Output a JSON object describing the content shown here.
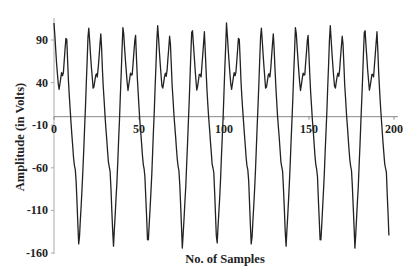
{
  "chart_data": {
    "type": "line",
    "title": "",
    "xlabel": "No. of Samples",
    "ylabel": "Amplitude (in Volts)",
    "xlim": [
      0,
      200
    ],
    "ylim": [
      -160,
      110
    ],
    "x_ticks": [
      0,
      50,
      100,
      150,
      200
    ],
    "y_ticks": [
      90,
      40,
      -10,
      -60,
      -110,
      -160
    ],
    "grid": false,
    "legend": null,
    "series": [
      {
        "name": "Amplitude",
        "color": "#222222",
        "sample_range": [
          0,
          197
        ],
        "period_samples": 20.3,
        "cycle_template": [
          {
            "phase": 0.0,
            "value": 110
          },
          {
            "phase": 0.08,
            "value": 60
          },
          {
            "phase": 0.14,
            "value": 30
          },
          {
            "phase": 0.22,
            "value": 52
          },
          {
            "phase": 0.26,
            "value": 46
          },
          {
            "phase": 0.36,
            "value": 100
          },
          {
            "phase": 0.42,
            "value": 40
          },
          {
            "phase": 0.48,
            "value": 0
          },
          {
            "phase": 0.58,
            "value": -55
          },
          {
            "phase": 0.63,
            "value": -65
          },
          {
            "phase": 0.72,
            "value": -155
          },
          {
            "phase": 0.82,
            "value": -80
          },
          {
            "phase": 0.9,
            "value": 0
          },
          {
            "phase": 1.0,
            "value": 110
          }
        ],
        "first_cycle_x": [
          0,
          1,
          2,
          3,
          4,
          5,
          6,
          7,
          8,
          9,
          10,
          11,
          12,
          13,
          14,
          15,
          16,
          17,
          18,
          19,
          20
        ],
        "first_cycle_y": [
          110,
          79,
          50,
          32,
          46,
          48,
          65,
          92,
          66,
          25,
          -7,
          -34,
          -57,
          -75,
          -125,
          -141,
          -104,
          -63,
          -13,
          40,
          94
        ],
        "end_value": -125
      }
    ],
    "zero_line": {
      "y": 0,
      "color": "#888888"
    }
  },
  "axes": {
    "x_tick_labels": [
      "0",
      "50",
      "100",
      "150",
      "200"
    ],
    "y_tick_labels": [
      "90",
      "40",
      "-10",
      "-60",
      "-110",
      "-160"
    ],
    "x_title": "No. of Samples",
    "y_title": "Amplitude (in Volts)"
  }
}
